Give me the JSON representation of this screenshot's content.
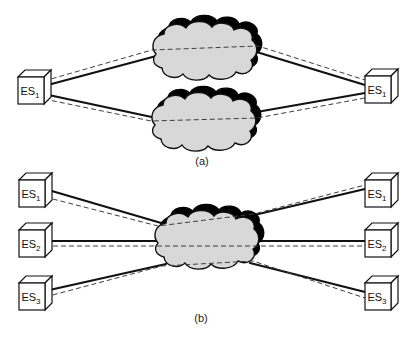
{
  "figure": {
    "background": "#ffffff",
    "palette": {
      "cloud_fill": "#d8d8d8",
      "cloud_shadow": "#000000",
      "outline": "#111111",
      "node_fill": "#ffffff",
      "solid_link": "#111111",
      "dashed_link": "#3d3d3d"
    },
    "sections": [
      {
        "caption": "(a)",
        "cloud_count": 2,
        "left_nodes": [
          {
            "base": "ES",
            "sub": "1"
          }
        ],
        "right_nodes": [
          {
            "base": "ES",
            "sub": "1"
          }
        ]
      },
      {
        "caption": "(b)",
        "cloud_count": 1,
        "left_nodes": [
          {
            "base": "ES",
            "sub": "1"
          },
          {
            "base": "ES",
            "sub": "2"
          },
          {
            "base": "ES",
            "sub": "3"
          }
        ],
        "right_nodes": [
          {
            "base": "ES",
            "sub": "1"
          },
          {
            "base": "ES",
            "sub": "2"
          },
          {
            "base": "ES",
            "sub": "3"
          }
        ]
      }
    ]
  }
}
